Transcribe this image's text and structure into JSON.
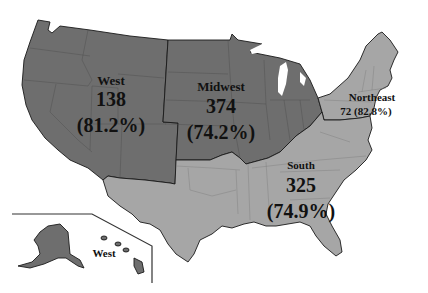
{
  "map": {
    "type": "choropleth",
    "subject": "United States census regions",
    "regions": [
      {
        "name": "West",
        "count": "138",
        "percent": "(81.2%)",
        "shade": "dark",
        "color": "#6e6e6e"
      },
      {
        "name": "Midwest",
        "count": "374",
        "percent": "(74.2%)",
        "shade": "dark",
        "color": "#6e6e6e"
      },
      {
        "name": "Northeast",
        "count": "72",
        "percent": "(82.8%)",
        "combined": "72 (82.8%)",
        "shade": "light",
        "color": "#a6a6a6"
      },
      {
        "name": "South",
        "count": "325",
        "percent": "(74.9%)",
        "shade": "light",
        "color": "#a6a6a6"
      }
    ],
    "inset": {
      "label": "West",
      "contains": [
        "Alaska",
        "Hawaii"
      ]
    }
  },
  "colors": {
    "dark_region": "#6e6e6e",
    "light_region": "#a6a6a6",
    "border": "#1a1a1a",
    "background": "#ffffff"
  }
}
